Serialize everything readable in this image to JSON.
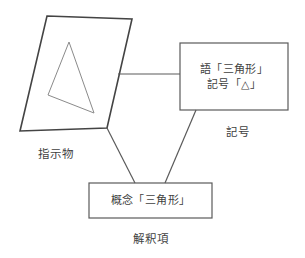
{
  "diagram": {
    "stroke_color": "#444444",
    "thin_stroke_color": "#8a8a8a",
    "background": "#ffffff",
    "nodes": {
      "referent": {
        "shape": "parallelogram",
        "inner_shape": "triangle",
        "label": "指示物"
      },
      "sign": {
        "shape": "rectangle",
        "line1": "語「三角形」",
        "line2": "記号「△」",
        "label": "記号"
      },
      "interpretant": {
        "shape": "rectangle",
        "line1": "概念「三角形」",
        "label": "解釈項"
      }
    },
    "connectors": [
      {
        "name": "referent-to-sign",
        "from": "referent",
        "to": "sign",
        "style": "straight-horizontal"
      },
      {
        "name": "referent-to-interpretant",
        "from": "referent",
        "to": "interpretant",
        "style": "diagonal"
      },
      {
        "name": "sign-to-interpretant",
        "from": "sign",
        "to": "interpretant",
        "style": "diagonal"
      }
    ],
    "geometry": {
      "parallelogram_points": "47,16 132,19 107,128 20,131",
      "inner_triangle_points": "69,42 94,113 48,95",
      "connector_referent_sign": "118,74 180,74",
      "connector_referent_interpretant": "107,128 135,183",
      "connector_sign_interpretant": "196,110 165,183",
      "sign_box_rect": "180,43 108,67",
      "concept_box_rect": "89,183 123,35"
    }
  }
}
